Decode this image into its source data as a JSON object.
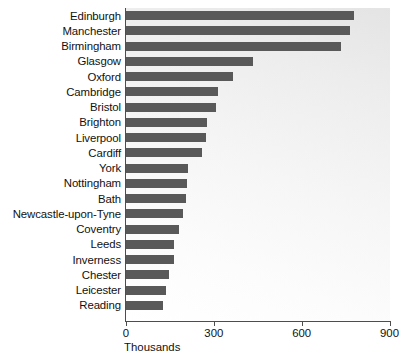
{
  "chart_data": {
    "type": "bar",
    "orientation": "horizontal",
    "title": "",
    "subtitle": "",
    "xlabel": "Thousands",
    "ylabel": "",
    "xlim": [
      0,
      900
    ],
    "xticks": [
      0,
      300,
      600,
      900
    ],
    "xtick_labels": [
      "0",
      "300",
      "600",
      "900"
    ],
    "grid": false,
    "legend": null,
    "bar_color": "#595959",
    "plot_background": "#f2f2f2",
    "axis_color": "#4d4d4d",
    "categories": [
      "Edinburgh",
      "Manchester",
      "Birmingham",
      "Glasgow",
      "Oxford",
      "Cambridge",
      "Bristol",
      "Brighton",
      "Liverpool",
      "Cardiff",
      "York",
      "Nottingham",
      "Bath",
      "Newcastle-upon-Tyne",
      "Coventry",
      "Leeds",
      "Inverness",
      "Chester",
      "Leicester",
      "Reading"
    ],
    "values": [
      780,
      765,
      735,
      435,
      365,
      315,
      308,
      275,
      273,
      260,
      212,
      208,
      205,
      195,
      182,
      165,
      164,
      147,
      137,
      127
    ]
  }
}
